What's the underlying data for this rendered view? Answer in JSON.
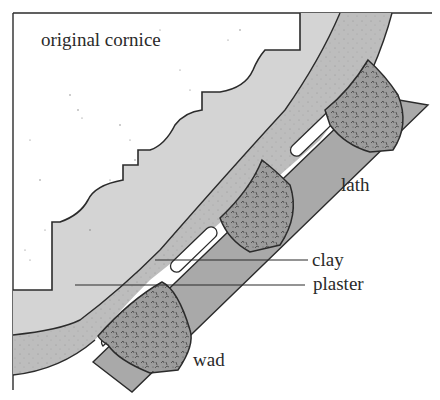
{
  "diagram": {
    "labels": {
      "original_cornice": "original cornice",
      "lath": "lath",
      "clay": "clay",
      "plaster": "plaster",
      "wad": "wad"
    },
    "colors": {
      "background": "#ffffff",
      "outline": "#2b2b2b",
      "cornice_fill": "#fbfbfb",
      "backing_layer": "#d4d4d4",
      "plaster_band": "#bdbdbd",
      "lath": "#a9a9a9",
      "wad": "#9a9a9a",
      "gap": "#ffffff"
    },
    "wad_count": 3
  }
}
